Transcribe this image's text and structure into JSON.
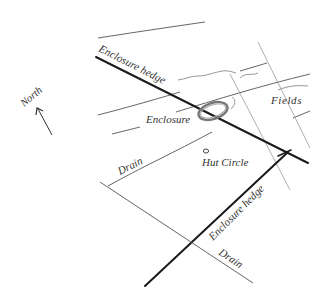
{
  "diagram": {
    "type": "archaeological site sketch map",
    "labels": {
      "north": "North",
      "enclosure_hedge_top": "Enclosure hedge",
      "enclosure": "Enclosure",
      "fields": "Fields",
      "drain_upper": "Drain",
      "hut_circle": "Hut Circle",
      "enclosure_hedge_bottom": "Enclosure hedge",
      "drain_lower": "Drain"
    },
    "colors": {
      "background": "#ffffff",
      "hedge_line": "#1a1a1a",
      "thin_line": "#555555",
      "text": "#333333"
    }
  }
}
